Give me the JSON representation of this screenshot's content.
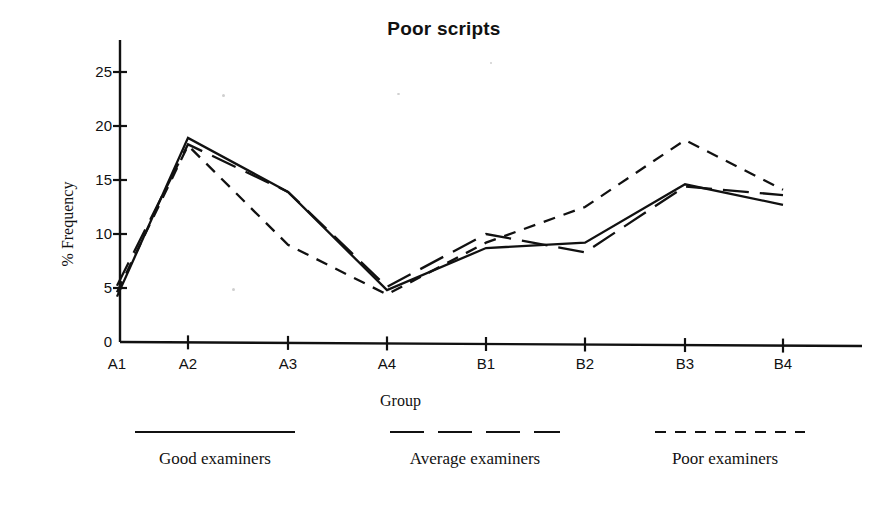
{
  "chart_data": {
    "type": "line",
    "title": "Poor scripts",
    "xlabel": "Group",
    "ylabel": "% Frequency",
    "categories": [
      "A1",
      "A2",
      "A3",
      "A4",
      "B1",
      "B2",
      "B3",
      "B4"
    ],
    "ylim": [
      0,
      27.5
    ],
    "yticks": [
      0,
      5,
      10,
      15,
      20,
      25
    ],
    "ytick_labels": [
      "0",
      "5",
      "10",
      "15",
      "20",
      "25"
    ],
    "grid": false,
    "legend_position": "below",
    "series": [
      {
        "name": "Good examiners",
        "style": "solid",
        "values": [
          4.2,
          18.9,
          13.9,
          4.8,
          8.7,
          9.2,
          14.6,
          12.7
        ]
      },
      {
        "name": "Average examiners",
        "style": "long-dash",
        "values": [
          5.2,
          18.3,
          13.9,
          5.1,
          10.0,
          8.3,
          14.4,
          13.6
        ]
      },
      {
        "name": "Poor examiners",
        "style": "short-dash",
        "values": [
          4.6,
          18.2,
          9.0,
          4.4,
          9.2,
          12.5,
          18.7,
          14.1
        ]
      }
    ]
  },
  "legend": {
    "entries": [
      {
        "label": "Good examiners",
        "style": "solid"
      },
      {
        "label": "Average examiners",
        "style": "long-dash"
      },
      {
        "label": "Poor examiners",
        "style": "short-dash"
      }
    ]
  },
  "colors": {
    "ink": "#111111",
    "background": "#ffffff"
  }
}
